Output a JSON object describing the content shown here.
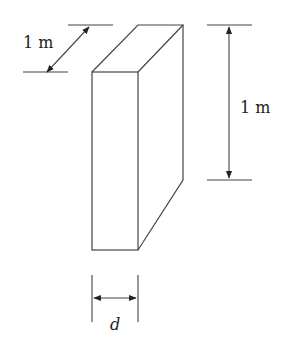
{
  "diagram": {
    "labels": {
      "depth_dimension": "1 m",
      "height_dimension": "1 m",
      "thickness_dimension": "d"
    },
    "colors": {
      "stroke": "#333333",
      "background": "#ffffff"
    }
  }
}
